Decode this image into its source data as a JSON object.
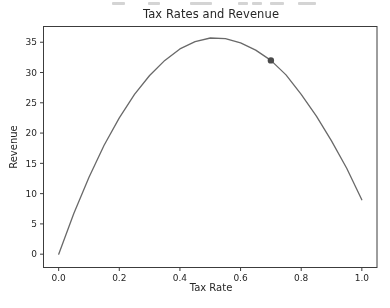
{
  "page": {
    "background": "#ffffff"
  },
  "colors": {
    "axis": "#3c3c3c",
    "text": "#262626",
    "curve": "#696969",
    "marker": "#4a4a4a"
  },
  "chart_data": {
    "type": "line",
    "title": "Tax Rates and Revenue",
    "xlabel": "Tax Rate",
    "ylabel": "Revenue",
    "xlim": [
      -0.05,
      1.05
    ],
    "ylim": [
      -2.2,
      37.6
    ],
    "grid": false,
    "legend_position": "none",
    "x_ticks": {
      "values": [
        0.0,
        0.2,
        0.4,
        0.6,
        0.8,
        1.0
      ],
      "labels": [
        "0.0",
        "0.2",
        "0.4",
        "0.6",
        "0.8",
        "1.0"
      ]
    },
    "y_ticks": {
      "values": [
        0,
        5,
        10,
        15,
        20,
        25,
        30,
        35
      ],
      "labels": [
        "0",
        "5",
        "10",
        "15",
        "20",
        "25",
        "30",
        "35"
      ]
    },
    "series": [
      {
        "name": "revenue-curve",
        "color": "#696969",
        "x": [
          0.0,
          0.05,
          0.1,
          0.15,
          0.2,
          0.25,
          0.3,
          0.35,
          0.4,
          0.45,
          0.5,
          0.55,
          0.6,
          0.65,
          0.7,
          0.75,
          0.8,
          0.85,
          0.9,
          0.95,
          1.0
        ],
        "y": [
          0.0,
          6.7,
          12.7,
          18.0,
          22.5,
          26.4,
          29.5,
          32.0,
          33.9,
          35.1,
          35.7,
          35.6,
          34.9,
          33.7,
          32.0,
          29.6,
          26.4,
          22.8,
          18.7,
          14.2,
          9.0
        ]
      }
    ],
    "annotations": [
      {
        "name": "current-rate-marker",
        "type": "point",
        "x": 0.7,
        "y": 32,
        "color": "#4a4a4a",
        "radius": 3.2
      }
    ]
  }
}
